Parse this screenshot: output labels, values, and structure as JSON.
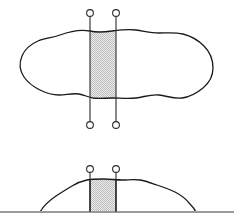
{
  "figure": {
    "background_color": "#ffffff",
    "canvas": {
      "width": 234,
      "height": 224
    },
    "outline_color": "#1a1a1a",
    "slice_fill_color": "#d8d8d8",
    "slice_pattern": "checkerboard-dither",
    "marker_color": "#2b2b2b",
    "ground_color": "#9a9a9a",
    "views": [
      {
        "id": "plan-view",
        "name": "Plan view (top)",
        "label": "",
        "outline_d": "M 90 31 C 80 29 68 32 60 35 C 52 38 45 38 38 41 C 31 44 25 49 22 56 C 19 63 20 71 24 77 C 28 83 34 87 40 90 C 46 93 52 95 59 95 C 66 95 72 93 79 94 C 84 95 88 97 93 98 C 99 99 105 98 112 98 C 120 98 128 99 136 98 C 144 97 151 94 159 95 C 167 96 174 99 182 98 C 190 97 197 93 203 88 C 209 83 213 76 213 68 C 213 60 210 52 204 46 C 198 40 191 36 183 34 C 175 32 167 33 159 33 C 151 33 144 31 136 30 C 128 29 120 30 112 31 C 105 32 98 33 90 31 Z",
        "slice": {
          "x_left": 90,
          "x_right": 116,
          "y_top": 31,
          "y_bottom": 98
        },
        "markers": [
          {
            "x": 90,
            "y": 13,
            "r": 3.4
          },
          {
            "x": 116,
            "y": 13,
            "r": 3.4
          },
          {
            "x": 90,
            "y": 125,
            "r": 3.4
          },
          {
            "x": 116,
            "y": 125,
            "r": 3.4
          }
        ],
        "section_lines": [
          {
            "x": 90,
            "y1": 16,
            "y2": 122
          },
          {
            "x": 116,
            "y1": 16,
            "y2": 122
          }
        ]
      },
      {
        "id": "elevation-view",
        "name": "Elevation view (bottom)",
        "label": "",
        "outline_d": "M 40 212 C 44 205 50 200 56 196 C 62 192 67 189 72 186 C 77 183 82 181 87 180 C 92 179 98 179 104 179 C 110 179 116 180 122 180 C 128 180 134 179 140 180 C 146 181 151 183 157 185 C 163 187 169 189 175 192 C 181 195 186 199 190 204 C 193 207 195 210 196 212",
        "ground": {
          "x1": 0,
          "x2": 234,
          "y": 212
        },
        "slice": {
          "x_left": 90,
          "x_right": 116,
          "y_top": 179.5,
          "y_bottom": 212
        },
        "markers": [
          {
            "x": 90,
            "y": 169,
            "r": 3.4
          },
          {
            "x": 116,
            "y": 169,
            "r": 3.4
          }
        ],
        "section_lines": [
          {
            "x": 90,
            "y1": 172,
            "y2": 212
          },
          {
            "x": 116,
            "y1": 172,
            "y2": 212
          }
        ]
      }
    ]
  }
}
